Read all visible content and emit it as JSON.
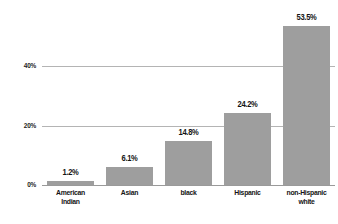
{
  "chart_data": {
    "type": "bar",
    "title": "",
    "subtitle": "",
    "xlabel": "",
    "ylabel": "",
    "categories": [
      "American\nIndian",
      "Asian",
      "black",
      "Hispanic",
      "non-Hispanic\nwhite"
    ],
    "values": [
      1.2,
      6.1,
      14.8,
      24.2,
      53.5
    ],
    "value_labels": [
      "1.2%",
      "6.1%",
      "14.8%",
      "24.2%",
      "53.5%"
    ],
    "ylim": [
      0,
      62
    ],
    "yticks": [
      0,
      20,
      40
    ],
    "ytick_labels": [
      "0%",
      "20%",
      "40%"
    ],
    "grid": true,
    "grid_axis": "y",
    "legend": false,
    "legend_position": "none",
    "bar_color": "#9e9e9e",
    "grid_color": "#b4b4b4",
    "axis_color": "#9a9a9a",
    "text_color": "#141414",
    "background": "#ffffff"
  }
}
